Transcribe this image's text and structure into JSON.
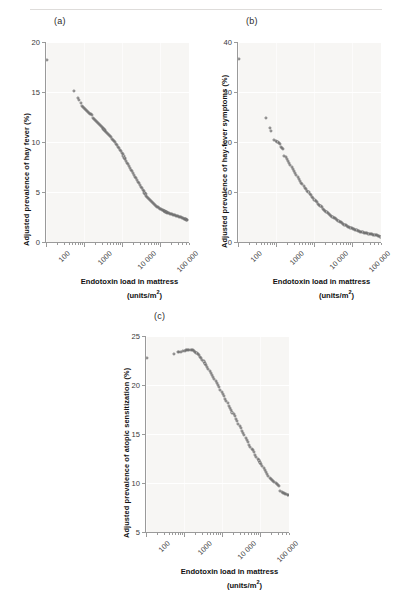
{
  "figure": {
    "panel_a_label": "(a)",
    "panel_b_label": "(b)",
    "panel_c_label": "(c)",
    "xtitle_line1": "Endotoxin load in mattress",
    "xtitle_line2_pre": "(units/m",
    "xtitle_line2_sup": "2",
    "xtitle_line2_post": ")",
    "marker_color": "#6f6f6f",
    "plot_bg": "#f7f6f4",
    "grid_color": "#ffffff",
    "axis_color": "#9a9a9a"
  },
  "chart_data": [
    {
      "type": "scatter",
      "panel": "(a)",
      "title": "",
      "xlabel": "Endotoxin load in mattress (units/m2)",
      "ylabel": "Adjusted prevalence of hay fever (%)",
      "xscale": "log",
      "xlim": [
        100,
        600000
      ],
      "ylim": [
        0,
        20
      ],
      "yticks": [
        0,
        5,
        10,
        15,
        20
      ],
      "ytick_labels": [
        "0",
        "5",
        "10",
        "15",
        "20"
      ],
      "xticks": [
        100,
        1000,
        10000,
        100000
      ],
      "xtick_labels": [
        "100",
        "1000",
        "10 000",
        "100 000"
      ],
      "grid": true,
      "legend": "none",
      "x": [
        105,
        540,
        700,
        760,
        820,
        900,
        960,
        1020,
        1080,
        1150,
        1220,
        1300,
        1380,
        1460,
        1550,
        1650,
        1750,
        1850,
        1960,
        2080,
        2200,
        2330,
        2470,
        2620,
        2780,
        2940,
        3120,
        3300,
        3500,
        3710,
        3930,
        4160,
        4410,
        4670,
        4950,
        5250,
        5560,
        5890,
        6240,
        6610,
        7010,
        7430,
        7870,
        8340,
        8840,
        9370,
        9930,
        10520,
        11150,
        11820,
        12520,
        13270,
        14060,
        14900,
        15790,
        16730,
        17730,
        18790,
        19910,
        21100,
        22360,
        23700,
        25110,
        26610,
        28200,
        29880,
        31660,
        33550,
        35550,
        37680,
        39920,
        42310,
        44840,
        47520,
        50360,
        53370,
        56560,
        59940,
        63520,
        67320,
        71340,
        75600,
        80120,
        84910,
        89980,
        95360,
        101000,
        107100,
        113500,
        120300,
        127500,
        135100,
        143200,
        151800,
        160900,
        170500,
        180700,
        191500,
        202900,
        215000,
        227900,
        241500,
        255900,
        271200,
        287400,
        304600,
        322800,
        342100,
        362600,
        384300,
        407300,
        431600,
        457400,
        484800,
        513700,
        544400
      ],
      "y": [
        18.2,
        15.1,
        14.4,
        14.2,
        13.9,
        13.6,
        13.5,
        13.4,
        13.3,
        13.2,
        13.1,
        13.0,
        12.9,
        12.8,
        12.8,
        12.7,
        12.4,
        12.3,
        12.2,
        12.1,
        12.0,
        11.9,
        11.8,
        11.7,
        11.6,
        11.5,
        11.4,
        11.3,
        11.2,
        11.1,
        11.0,
        10.9,
        10.8,
        10.7,
        10.6,
        10.5,
        10.3,
        10.2,
        10.1,
        10.0,
        9.8,
        9.7,
        9.5,
        9.4,
        9.2,
        9.1,
        8.9,
        8.8,
        8.6,
        8.4,
        8.3,
        8.1,
        7.9,
        7.8,
        7.6,
        7.4,
        7.2,
        7.1,
        6.9,
        6.7,
        6.5,
        6.4,
        6.2,
        6.0,
        5.9,
        5.7,
        5.5,
        5.4,
        5.2,
        5.1,
        4.9,
        4.8,
        4.6,
        4.5,
        4.4,
        4.3,
        4.2,
        4.1,
        4.0,
        3.9,
        3.8,
        3.7,
        3.6,
        3.55,
        3.5,
        3.42,
        3.35,
        3.3,
        3.25,
        3.2,
        3.15,
        3.1,
        3.05,
        3.0,
        2.95,
        2.9,
        2.87,
        2.84,
        2.8,
        2.77,
        2.74,
        2.7,
        2.67,
        2.64,
        2.6,
        2.57,
        2.54,
        2.5,
        2.46,
        2.42,
        2.38,
        2.34,
        2.3,
        2.26,
        2.22,
        2.18,
        2.12,
        1.85
      ]
    },
    {
      "type": "scatter",
      "panel": "(b)",
      "title": "",
      "xlabel": "Endotoxin load in mattress (units/m2)",
      "ylabel": "Adjusted prevalence of hay-fever symptoms (%)",
      "xscale": "log",
      "xlim": [
        100,
        600000
      ],
      "ylim": [
        0,
        40
      ],
      "yticks": [
        0,
        10,
        20,
        30,
        40
      ],
      "ytick_labels": [
        "0",
        "10",
        "20",
        "30",
        "40"
      ],
      "xticks": [
        100,
        1000,
        10000,
        100000
      ],
      "xtick_labels": [
        "100",
        "1000",
        "10 000",
        "100 000"
      ],
      "grid": true,
      "legend": "none",
      "x": [
        105,
        540,
        700,
        760,
        900,
        1020,
        1100,
        1180,
        1260,
        1350,
        1450,
        1560,
        1680,
        1800,
        1940,
        2090,
        2250,
        2420,
        2600,
        2800,
        3010,
        3240,
        3490,
        3750,
        4040,
        4340,
        4670,
        5030,
        5410,
        5820,
        6260,
        6740,
        7250,
        7800,
        8390,
        9030,
        9710,
        10450,
        11240,
        12090,
        13010,
        13990,
        15050,
        16190,
        17420,
        18740,
        20160,
        21690,
        23330,
        25100,
        27000,
        29050,
        31250,
        33620,
        36170,
        38910,
        41860,
        45040,
        48460,
        52130,
        56090,
        60340,
        64920,
        69840,
        75140,
        80840,
        86970,
        93560,
        100700,
        108300,
        116500,
        125300,
        134800,
        145000,
        156000,
        167800,
        180500,
        194200,
        208900,
        224700,
        241700,
        260000,
        279700,
        300900,
        323700,
        348200,
        374600,
        403000,
        433500,
        466400,
        501700,
        539700,
        580600
      ],
      "y": [
        36.6,
        24.9,
        22.8,
        22.3,
        20.5,
        20.3,
        20.1,
        19.9,
        19.7,
        19.0,
        18.8,
        18.6,
        17.3,
        17.1,
        16.6,
        16.2,
        15.8,
        15.4,
        15.0,
        14.6,
        14.2,
        13.8,
        13.4,
        13.0,
        12.6,
        12.3,
        11.9,
        11.6,
        11.2,
        10.9,
        10.6,
        10.3,
        10.0,
        9.7,
        9.4,
        9.1,
        8.8,
        8.5,
        8.2,
        8.0,
        7.7,
        7.4,
        7.2,
        7.0,
        6.7,
        6.5,
        6.3,
        6.1,
        5.9,
        5.7,
        5.5,
        5.3,
        5.1,
        4.9,
        4.75,
        4.6,
        4.4,
        4.25,
        4.1,
        3.95,
        3.8,
        3.65,
        3.5,
        3.4,
        3.25,
        3.1,
        3.0,
        2.9,
        2.8,
        2.7,
        2.6,
        2.5,
        2.4,
        2.3,
        2.2,
        2.1,
        2.05,
        1.95,
        1.9,
        1.85,
        1.8,
        1.75,
        1.7,
        1.65,
        1.6,
        1.55,
        1.5,
        1.45,
        1.4,
        1.35,
        1.3,
        1.2,
        1.1
      ]
    },
    {
      "type": "scatter",
      "panel": "(c)",
      "title": "",
      "xlabel": "Endotoxin load in mattress (units/m2)",
      "ylabel": "Adjusted prevalence of atopic sensitization (%)",
      "xscale": "log",
      "xlim": [
        100,
        600000
      ],
      "ylim": [
        5,
        25
      ],
      "yticks": [
        5,
        10,
        15,
        20,
        25
      ],
      "ytick_labels": [
        "5",
        "10",
        "15",
        "20",
        "25"
      ],
      "xticks": [
        100,
        1000,
        10000,
        100000
      ],
      "xtick_labels": [
        "100",
        "1000",
        "10 000",
        "100 000"
      ],
      "grid": true,
      "legend": "none",
      "x": [
        105,
        540,
        680,
        760,
        830,
        950,
        1050,
        1130,
        1220,
        1310,
        1400,
        1500,
        1610,
        1730,
        1860,
        2000,
        2150,
        2310,
        2480,
        2670,
        2870,
        3090,
        3320,
        3570,
        3840,
        4130,
        4440,
        4780,
        5140,
        5530,
        5950,
        6400,
        6880,
        7400,
        7960,
        8560,
        9210,
        9910,
        10660,
        11470,
        12340,
        13280,
        14290,
        15370,
        16540,
        17790,
        19140,
        20590,
        22150,
        23830,
        25640,
        27580,
        29670,
        31920,
        34340,
        36940,
        39740,
        42750,
        45990,
        49470,
        53220,
        57250,
        61590,
        66260,
        71280,
        76680,
        82490,
        88740,
        95460,
        102700,
        110500,
        118900,
        127900,
        137600,
        148000,
        159200,
        171300,
        184300,
        198200,
        213200,
        229400,
        246800,
        265500,
        285600,
        307200,
        330500,
        355500,
        382400,
        411400,
        442600,
        476100,
        512200,
        551000,
        570000
      ],
      "y": [
        22.8,
        23.2,
        23.4,
        23.4,
        23.4,
        23.5,
        23.5,
        23.55,
        23.6,
        23.6,
        23.6,
        23.6,
        23.6,
        23.55,
        23.5,
        23.4,
        23.3,
        23.2,
        23.1,
        22.9,
        22.8,
        22.6,
        22.4,
        22.2,
        22.0,
        21.8,
        21.6,
        21.4,
        21.2,
        21.0,
        20.8,
        20.6,
        20.4,
        20.2,
        20.0,
        19.8,
        19.5,
        19.3,
        19.1,
        18.9,
        18.6,
        18.4,
        18.2,
        17.9,
        17.7,
        17.5,
        17.2,
        17.0,
        16.8,
        16.5,
        16.3,
        16.0,
        15.8,
        15.6,
        15.3,
        15.1,
        14.9,
        14.6,
        14.4,
        14.2,
        13.9,
        13.7,
        13.5,
        13.4,
        13.2,
        12.9,
        12.7,
        12.5,
        12.3,
        12.1,
        11.9,
        11.7,
        11.5,
        11.3,
        11.1,
        10.9,
        10.7,
        10.5,
        10.4,
        10.3,
        10.2,
        10.1,
        10.0,
        9.9,
        9.8,
        9.7,
        9.2,
        9.1,
        9.0,
        8.95,
        8.9,
        8.85,
        8.8,
        8.75
      ]
    }
  ]
}
